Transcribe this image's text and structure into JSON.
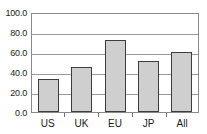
{
  "chart_data": {
    "type": "bar",
    "title": "",
    "subtitle": "",
    "xlabel": "",
    "ylabel": "",
    "categories": [
      "US",
      "UK",
      "EU",
      "JP",
      "All"
    ],
    "values": [
      34,
      46,
      73,
      52,
      61
    ],
    "series": [
      {
        "name": "",
        "values": [
          34,
          46,
          73,
          52,
          61
        ]
      }
    ],
    "ylim": [
      0,
      100
    ],
    "ytick_values": [
      0,
      20,
      40,
      60,
      80,
      100
    ],
    "ytick_labels": [
      "0.0",
      "20.0",
      "40.0",
      "60.0",
      "80.0",
      "100.0"
    ],
    "grid": true,
    "grid_axis": "y",
    "legend": false,
    "legend_position": "none",
    "annotations": [],
    "colors": {
      "bar_fill": "#cfcfcf",
      "bar_border": "#3d3d3d",
      "gridline": "#9a9a9a",
      "axis_frame": "#8a8a8a",
      "text": "#1a1a1a",
      "background": "#ffffff"
    }
  }
}
